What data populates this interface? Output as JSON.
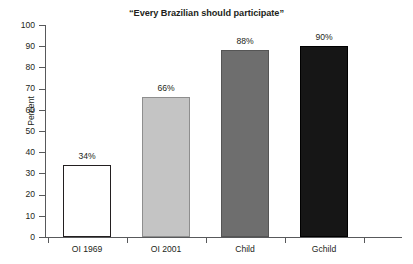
{
  "chart_data": {
    "type": "bar",
    "title": "“Every Brazilian should participate”",
    "xlabel": "",
    "ylabel": "Percent",
    "categories": [
      "OI 1969",
      "OI 2001",
      "Child",
      "Gchild"
    ],
    "values": [
      34,
      66,
      88,
      90
    ],
    "value_labels": [
      "34%",
      "66%",
      "88%",
      "90%"
    ],
    "ylim": [
      0,
      100
    ],
    "ytick_labels": [
      "0",
      "10",
      "20",
      "30",
      "40",
      "50",
      "60",
      "70",
      "80",
      "90",
      "100"
    ],
    "ytick_values": [
      0,
      10,
      20,
      30,
      40,
      50,
      60,
      70,
      80,
      90,
      100
    ],
    "grid": false,
    "legend": false,
    "bar_colors": [
      "#ffffff",
      "#c4c4c4",
      "#6e6e6e",
      "#161616"
    ],
    "bar_edge_colors": [
      "#231f20",
      "#8e8e8e",
      "#555555",
      "#000000"
    ],
    "axis_color": "#58595b",
    "text_color": "#231f20"
  }
}
